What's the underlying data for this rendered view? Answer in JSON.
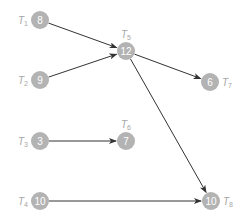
{
  "diagram": {
    "type": "task-dependency-graph",
    "node_color": "#b3b3b3",
    "edge_color": "#333333",
    "label_color": "#a6a6a6",
    "nodes": [
      {
        "id": "T1",
        "label_main": "T",
        "label_sub": "1",
        "value": "8",
        "x": 40,
        "y": 20,
        "label_pos": "left"
      },
      {
        "id": "T2",
        "label_main": "T",
        "label_sub": "2",
        "value": "9",
        "x": 40,
        "y": 80,
        "label_pos": "left"
      },
      {
        "id": "T3",
        "label_main": "T",
        "label_sub": "3",
        "value": "3",
        "x": 40,
        "y": 141,
        "label_pos": "left"
      },
      {
        "id": "T4",
        "label_main": "T",
        "label_sub": "4",
        "value": "10",
        "x": 40,
        "y": 201,
        "label_pos": "left"
      },
      {
        "id": "T5",
        "label_main": "T",
        "label_sub": "5",
        "value": "12",
        "x": 126,
        "y": 51,
        "label_pos": "top"
      },
      {
        "id": "T6",
        "label_main": "T",
        "label_sub": "6",
        "value": "7",
        "x": 126,
        "y": 141,
        "label_pos": "top"
      },
      {
        "id": "T7",
        "label_main": "T",
        "label_sub": "7",
        "value": "6",
        "x": 210,
        "y": 82,
        "label_pos": "right"
      },
      {
        "id": "T8",
        "label_main": "T",
        "label_sub": "8",
        "value": "10",
        "x": 211,
        "y": 201,
        "label_pos": "right"
      }
    ],
    "edges": [
      {
        "from": "T1",
        "to": "T5"
      },
      {
        "from": "T2",
        "to": "T5"
      },
      {
        "from": "T5",
        "to": "T7"
      },
      {
        "from": "T5",
        "to": "T8"
      },
      {
        "from": "T3",
        "to": "T6"
      },
      {
        "from": "T4",
        "to": "T8"
      }
    ]
  }
}
